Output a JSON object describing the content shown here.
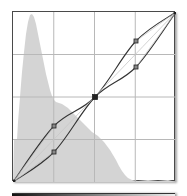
{
  "curves_graph": {
    "grid_divisions": 4,
    "colors": {
      "background": "#ffffff",
      "histogram": "#d4d4d4",
      "grid": "#b8b8b8",
      "curve": "#333333",
      "baseline": "#c8c8c8",
      "point": "#222222"
    },
    "histogram_points": "0,170 1,125 4,125 5,110 7,90 9,70 11,50 13,30 15,15 17,7 19,4 21,3 23,5 25,12 27,22 29,32 31,42 33,52 35,62 37,72 39,80 41,88 43,96 45,104 47,112 49,118 51,124 53,129 55,133 57,136 59,138 61,139 63,140 65,141 67,143 69,145 71,147 73,149 75,151 77,153 79,155 81,158 82,163 83,166 84,168 85,170 90,170 95,168 100,169 105,170",
    "histogram_points_abs": "0,170 1,127 4,127 5,112 7,100 8,80 10,55 12,40 15,30 18,24 22,22 26,28 30,38 34,50 38,62 41,72 45,84 50,95 55,100 60,103 65,105 70,108 75,112 80,116 83,120 86,86",
    "curves": [
      {
        "name": "upper-curve",
        "points": [
          [
            0,
            170
          ],
          [
            41,
            114
          ],
          [
            82,
            85
          ],
          [
            123,
            29
          ],
          [
            163,
            0
          ]
        ]
      },
      {
        "name": "lower-curve",
        "points": [
          [
            0,
            170
          ],
          [
            41,
            140
          ],
          [
            82,
            85
          ],
          [
            123,
            55
          ],
          [
            163,
            0
          ]
        ]
      },
      {
        "name": "baseline-diagonal",
        "points": [
          [
            0,
            170
          ],
          [
            163,
            0
          ]
        ]
      }
    ],
    "control_points": [
      {
        "name": "upper-left-point",
        "x": 41,
        "y": 114
      },
      {
        "name": "lower-left-point",
        "x": 41,
        "y": 140
      },
      {
        "name": "center-point",
        "x": 82,
        "y": 85
      },
      {
        "name": "upper-right-point",
        "x": 123,
        "y": 29
      },
      {
        "name": "lower-right-point",
        "x": 123,
        "y": 55
      },
      {
        "name": "black-endpoint",
        "x": 0,
        "y": 170
      },
      {
        "name": "white-endpoint",
        "x": 163,
        "y": 0
      }
    ]
  },
  "gradient_bar": {
    "visible": true
  }
}
